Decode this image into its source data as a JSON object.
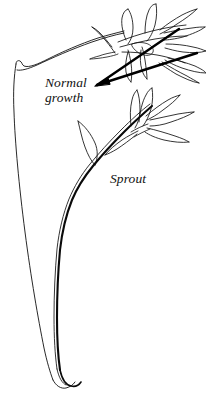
{
  "figure": {
    "type": "botanical-line-drawing",
    "background_color": "#ffffff",
    "ink_color": "#111111",
    "width": 206,
    "height": 396
  },
  "labels": {
    "normal_growth": {
      "line1": "Normal",
      "line2": "growth",
      "full": "Normal growth",
      "style": "italic-serif",
      "points_to": "upper-leaf-cluster"
    },
    "sprout": {
      "text": "Sprout",
      "style": "italic-serif",
      "points_to": "secondary-shoot"
    }
  },
  "drawing_parts": {
    "main_stem": "long-curved-double-line-stem",
    "upper_leaf_cluster": "normal-growth-leaves",
    "sprout_stem": "thick-dark-secondary-shoot",
    "sprout_leaf_cluster": "sprout-leaves",
    "sprout_side_leaf": "single-curved-leaf",
    "pointer_lines": "two-thick-converging-leader-lines",
    "root_tip": "hooked-base-tip"
  }
}
